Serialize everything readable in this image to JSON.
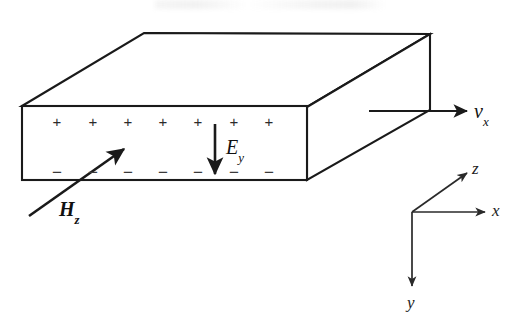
{
  "figure": {
    "stroke_color": "#1a1a1a",
    "fill_color": "#ffffff",
    "text_color": "#111111"
  },
  "slab": {
    "name": "conducting-slab",
    "front_face": {
      "left": 22,
      "right": 307,
      "top": 106,
      "bottom": 180
    },
    "depth_offset": {
      "dx": 122,
      "dy": -72
    }
  },
  "charges": {
    "positive_symbol": "+",
    "negative_symbol": "−",
    "count": 7,
    "positive_row_y": 122,
    "negative_row_y": 172,
    "x_positions": [
      57,
      93,
      128,
      163,
      198,
      234,
      269
    ]
  },
  "vectors": [
    {
      "name": "hall-field",
      "label": "E",
      "subscript": "y",
      "style": "italic",
      "direction": "down",
      "label_x": 226,
      "label_y": 137
    },
    {
      "name": "magnetic-field",
      "label": "H",
      "subscript": "z",
      "style": "bold-italic",
      "direction": "up-right",
      "label_x": 59,
      "label_y": 199
    },
    {
      "name": "drift-velocity",
      "label": "v",
      "subscript": "x",
      "style": "italic",
      "direction": "right",
      "label_x": 474,
      "label_y": 101
    }
  ],
  "axes": {
    "name": "coordinate-triad",
    "origin": {
      "x": 412,
      "y": 212
    },
    "items": [
      {
        "label": "z",
        "direction": "up-right",
        "label_x": 472,
        "label_y": 160
      },
      {
        "label": "x",
        "direction": "right",
        "label_x": 492,
        "label_y": 202
      },
      {
        "label": "y",
        "direction": "down",
        "label_x": 407,
        "label_y": 294
      }
    ]
  }
}
